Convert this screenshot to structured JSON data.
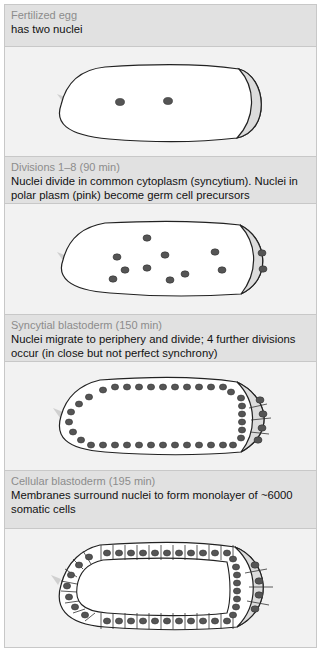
{
  "panels": [
    {
      "stage": "Fertilized egg",
      "description": "has two nuclei",
      "figure": "egg-with-two-nuclei"
    },
    {
      "stage": "Divisions 1–8 (90 min)",
      "description": "Nuclei divide in common cytoplasm (syncytium). Nuclei in polar plasm (pink) become germ cell precursors",
      "figure": "syncytium-scattered-nuclei"
    },
    {
      "stage": "Syncytial blastoderm (150 min)",
      "description": "Nuclei migrate to periphery and divide; 4 further divisions occur (in close but not perfect synchrony)",
      "figure": "syncytial-blastoderm"
    },
    {
      "stage": "Cellular blastoderm (195 min)",
      "description": "Membranes surround nuclei to form monolayer of ~6000 somatic cells",
      "figure": "cellular-blastoderm"
    }
  ],
  "colors": {
    "header_bg": "#e1e1e1",
    "figure_bg": "#f2f2f2",
    "stage_text": "#8c8c8c",
    "description_text": "#111111",
    "egg_fill": "#ffffff",
    "egg_outline": "#222222",
    "polar_plasm": "#dcdcdc",
    "nucleus": "#555555"
  }
}
